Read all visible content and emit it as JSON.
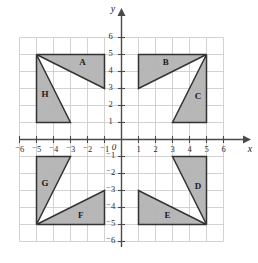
{
  "figure": {
    "background_color": "#ffffff",
    "grid_color": "#c8c8c8",
    "axis_color": "#4a4a4a",
    "shape_fill_color": "#b3b3b3",
    "shape_stroke_color": "#333333"
  },
  "chart_data": {
    "type": "scatter",
    "title": "",
    "xlabel": "x",
    "ylabel": "y",
    "xlim": [
      -6,
      6
    ],
    "ylim": [
      -6,
      6
    ],
    "grid": true,
    "legend": "none",
    "x_ticks": [
      "⁻6",
      "⁻5",
      "⁻4",
      "⁻3",
      "⁻2",
      "⁻1",
      "1",
      "2",
      "3",
      "4",
      "5",
      "6"
    ],
    "x_tick_values": [
      -6,
      -5,
      -4,
      -3,
      -2,
      -1,
      1,
      2,
      3,
      4,
      5,
      6
    ],
    "y_ticks": [
      "6",
      "5",
      "4",
      "3",
      "2",
      "1",
      "⁻1",
      "⁻2",
      "⁻3",
      "⁻4",
      "⁻5",
      "⁻6"
    ],
    "y_tick_values": [
      6,
      5,
      4,
      3,
      2,
      1,
      -1,
      -2,
      -3,
      -4,
      -5,
      -6
    ],
    "origin_label": "0",
    "shapes": [
      {
        "label": "A",
        "quadrant": "II",
        "vertices": [
          [
            -5,
            5
          ],
          [
            -1,
            5
          ],
          [
            -1,
            3
          ]
        ],
        "label_pos": [
          -2.3,
          4.5
        ]
      },
      {
        "label": "B",
        "quadrant": "I",
        "vertices": [
          [
            1,
            5
          ],
          [
            5,
            5
          ],
          [
            1,
            3
          ]
        ],
        "label_pos": [
          2.6,
          4.5
        ]
      },
      {
        "label": "C",
        "quadrant": "I",
        "vertices": [
          [
            5,
            5
          ],
          [
            5,
            1
          ],
          [
            3,
            1
          ]
        ],
        "label_pos": [
          4.5,
          2.5
        ]
      },
      {
        "label": "D",
        "quadrant": "IV",
        "vertices": [
          [
            3,
            -1
          ],
          [
            5,
            -1
          ],
          [
            5,
            -5
          ]
        ],
        "label_pos": [
          4.5,
          -2.8
        ]
      },
      {
        "label": "E",
        "quadrant": "IV",
        "vertices": [
          [
            1,
            -3
          ],
          [
            1,
            -5
          ],
          [
            5,
            -5
          ]
        ],
        "label_pos": [
          2.7,
          -4.5
        ]
      },
      {
        "label": "F",
        "quadrant": "III",
        "vertices": [
          [
            -5,
            -5
          ],
          [
            -1,
            -5
          ],
          [
            -1,
            -3
          ]
        ],
        "label_pos": [
          -2.4,
          -4.5
        ]
      },
      {
        "label": "G",
        "quadrant": "III",
        "vertices": [
          [
            -5,
            -1
          ],
          [
            -3,
            -1
          ],
          [
            -5,
            -5
          ]
        ],
        "label_pos": [
          -4.5,
          -2.6
        ]
      },
      {
        "label": "H",
        "quadrant": "II",
        "vertices": [
          [
            -5,
            5
          ],
          [
            -5,
            1
          ],
          [
            -3,
            1
          ]
        ],
        "label_pos": [
          -4.5,
          2.6
        ]
      }
    ]
  }
}
